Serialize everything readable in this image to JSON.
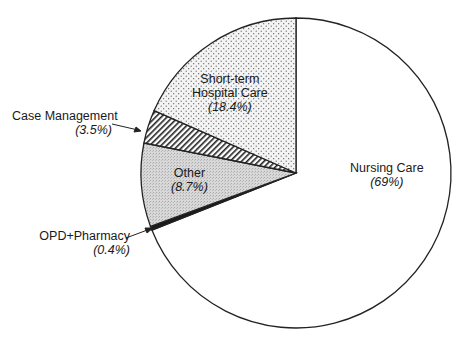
{
  "chart_data": {
    "type": "pie",
    "title": "",
    "start_angle": "12 o'clock, clockwise",
    "slices": [
      {
        "label": "Nursing Care",
        "value": 69,
        "pct_label": "(69%)",
        "fill": "#ffffff",
        "pattern": "none"
      },
      {
        "label": "OPD+Pharmacy",
        "value": 0.4,
        "pct_label": "(0.4%)",
        "fill": "#1a1a1a",
        "pattern": "solid"
      },
      {
        "label": "Other",
        "value": 8.7,
        "pct_label": "(8.7%)",
        "fill": "#d4d4d4",
        "pattern": "stipple-dense"
      },
      {
        "label": "Case Management",
        "value": 3.5,
        "pct_label": "(3.5%)",
        "fill": "#ffffff",
        "pattern": "diagonal-hatch"
      },
      {
        "label": "Short-term Hospital Care",
        "value": 18.4,
        "pct_label": "(18.4%)",
        "fill": "#f0f0f0",
        "pattern": "dots"
      }
    ]
  },
  "labels": {
    "nursing": {
      "name": "Nursing Care",
      "pct": "(69%)"
    },
    "opd": {
      "name": "OPD+Pharmacy",
      "pct": "(0.4%)"
    },
    "other": {
      "name": "Other",
      "pct": "(8.7%)"
    },
    "case": {
      "name": "Case Management",
      "pct": "(3.5%)"
    },
    "short": {
      "name1": "Short-term",
      "name2": "Hospital Care",
      "pct": "(18.4%)"
    }
  }
}
